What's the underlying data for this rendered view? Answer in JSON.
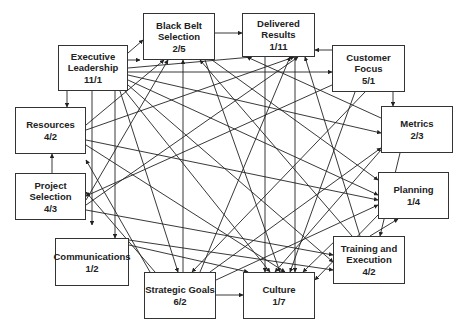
{
  "diagram": {
    "type": "interrelationship-digraph",
    "line_color": "#222222",
    "box_border_color": "#333333",
    "nodes": [
      {
        "id": "black_belt",
        "label": "Black Belt Selection",
        "line1": "Black Belt",
        "line2": "Selection",
        "score": "2/5",
        "x": 143,
        "y": 13,
        "w": 72,
        "h": 47
      },
      {
        "id": "exec_lead",
        "label": "Executive Leadership",
        "line1": "Executive",
        "line2": "Leadership",
        "score": "11/1",
        "x": 58,
        "y": 45,
        "w": 70,
        "h": 46
      },
      {
        "id": "delivered",
        "label": "Delivered Results",
        "line1": "Delivered",
        "line2": "Results",
        "score": "1/11",
        "x": 242,
        "y": 13,
        "w": 73,
        "h": 44
      },
      {
        "id": "customer",
        "label": "Customer Focus",
        "line1": "Customer",
        "line2": "Focus",
        "score": "5/1",
        "x": 332,
        "y": 45,
        "w": 73,
        "h": 47
      },
      {
        "id": "metrics",
        "label": "Metrics",
        "line1": "Metrics",
        "line2": "",
        "score": "2/3",
        "x": 381,
        "y": 106,
        "w": 72,
        "h": 47
      },
      {
        "id": "resources",
        "label": "Resources",
        "line1": "Resources",
        "line2": "",
        "score": "4/2",
        "x": 15,
        "y": 107,
        "w": 71,
        "h": 47
      },
      {
        "id": "project_sel",
        "label": "Project Selection",
        "line1": "Project",
        "line2": "Selection",
        "score": "4/3",
        "x": 15,
        "y": 173,
        "w": 71,
        "h": 47
      },
      {
        "id": "planning",
        "label": "Planning",
        "line1": "Planning",
        "line2": "",
        "score": "1/4",
        "x": 378,
        "y": 172,
        "w": 71,
        "h": 47
      },
      {
        "id": "communications",
        "label": "Communications",
        "line1": "Communications",
        "line2": "",
        "score": "1/2",
        "x": 55,
        "y": 238,
        "w": 74,
        "h": 48
      },
      {
        "id": "training",
        "label": "Training and Execution",
        "line1": "Training and",
        "line2": "Execution",
        "score": "4/2",
        "x": 333,
        "y": 236,
        "w": 72,
        "h": 48
      },
      {
        "id": "strategic",
        "label": "Strategic Goals",
        "line1": "Strategic Goals",
        "line2": "",
        "score": "6/2",
        "x": 144,
        "y": 272,
        "w": 72,
        "h": 47
      },
      {
        "id": "culture",
        "label": "Culture",
        "line1": "Culture",
        "line2": "",
        "score": "1/7",
        "x": 243,
        "y": 272,
        "w": 72,
        "h": 47
      }
    ],
    "edges": [
      {
        "from": "exec_lead",
        "to": "black_belt",
        "x1": 128,
        "y1": 53,
        "x2": 143,
        "y2": 40
      },
      {
        "from": "black_belt",
        "to": "delivered",
        "x1": 215,
        "y1": 33,
        "x2": 242,
        "y2": 33
      },
      {
        "from": "customer",
        "to": "delivered",
        "x1": 332,
        "y1": 50,
        "x2": 315,
        "y2": 50
      },
      {
        "from": "customer",
        "to": "metrics",
        "x1": 393,
        "y1": 92,
        "x2": 393,
        "y2": 106
      },
      {
        "from": "exec_lead",
        "to": "resources",
        "x1": 67,
        "y1": 91,
        "x2": 67,
        "y2": 107
      },
      {
        "from": "project_sel",
        "to": "resources",
        "x1": 52,
        "y1": 173,
        "x2": 52,
        "y2": 154
      },
      {
        "from": "strategic",
        "to": "culture",
        "x1": 216,
        "y1": 295,
        "x2": 243,
        "y2": 295
      },
      {
        "from": "exec_lead",
        "to": "customer",
        "x1": 128,
        "y1": 72,
        "x2": 332,
        "y2": 72
      },
      {
        "from": "exec_lead",
        "to": "communications",
        "x1": 115,
        "y1": 91,
        "x2": 115,
        "y2": 238
      },
      {
        "from": "exec_lead",
        "to": "project_sel",
        "x1": 92,
        "y1": 91,
        "x2": 92,
        "y2": 225
      },
      {
        "from": "exec_lead",
        "to": "metrics",
        "x1": 128,
        "y1": 75,
        "x2": 381,
        "y2": 133
      },
      {
        "from": "exec_lead",
        "to": "planning",
        "x1": 128,
        "y1": 80,
        "x2": 378,
        "y2": 195
      },
      {
        "from": "exec_lead",
        "to": "training",
        "x1": 128,
        "y1": 85,
        "x2": 333,
        "y2": 262
      },
      {
        "from": "exec_lead",
        "to": "strategic",
        "x1": 120,
        "y1": 91,
        "x2": 178,
        "y2": 272
      },
      {
        "from": "exec_lead",
        "to": "culture",
        "x1": 125,
        "y1": 91,
        "x2": 270,
        "y2": 272
      },
      {
        "from": "exec_lead",
        "to": "delivered",
        "x1": 128,
        "y1": 68,
        "x2": 252,
        "y2": 57
      },
      {
        "from": "strategic",
        "to": "black_belt",
        "x1": 183,
        "y1": 272,
        "x2": 183,
        "y2": 60
      },
      {
        "from": "strategic",
        "to": "delivered",
        "x1": 200,
        "y1": 272,
        "x2": 290,
        "y2": 57
      },
      {
        "from": "strategic",
        "to": "resources",
        "x1": 150,
        "y1": 272,
        "x2": 86,
        "y2": 160
      },
      {
        "from": "strategic",
        "to": "project_sel",
        "x1": 155,
        "y1": 272,
        "x2": 86,
        "y2": 192
      },
      {
        "from": "strategic",
        "to": "metrics",
        "x1": 210,
        "y1": 272,
        "x2": 381,
        "y2": 148
      },
      {
        "from": "strategic",
        "to": "planning",
        "x1": 216,
        "y1": 280,
        "x2": 378,
        "y2": 205
      },
      {
        "from": "customer",
        "to": "project_sel",
        "x1": 332,
        "y1": 85,
        "x2": 86,
        "y2": 196
      },
      {
        "from": "customer",
        "to": "culture",
        "x1": 355,
        "y1": 92,
        "x2": 290,
        "y2": 272
      },
      {
        "from": "customer",
        "to": "strategic",
        "x1": 365,
        "y1": 92,
        "x2": 192,
        "y2": 272
      },
      {
        "from": "training",
        "to": "planning",
        "x1": 370,
        "y1": 236,
        "x2": 398,
        "y2": 219
      },
      {
        "from": "training",
        "to": "delivered",
        "x1": 360,
        "y1": 236,
        "x2": 305,
        "y2": 57
      },
      {
        "from": "training",
        "to": "black_belt",
        "x1": 352,
        "y1": 236,
        "x2": 200,
        "y2": 60
      },
      {
        "from": "training",
        "to": "culture",
        "x1": 340,
        "y1": 236,
        "x2": 303,
        "y2": 272
      },
      {
        "from": "project_sel",
        "to": "black_belt",
        "x1": 86,
        "y1": 200,
        "x2": 168,
        "y2": 60
      },
      {
        "from": "project_sel",
        "to": "delivered",
        "x1": 86,
        "y1": 205,
        "x2": 298,
        "y2": 57
      },
      {
        "from": "project_sel",
        "to": "training",
        "x1": 86,
        "y1": 210,
        "x2": 333,
        "y2": 255
      },
      {
        "from": "resources",
        "to": "black_belt",
        "x1": 86,
        "y1": 125,
        "x2": 164,
        "y2": 60
      },
      {
        "from": "resources",
        "to": "delivered",
        "x1": 86,
        "y1": 130,
        "x2": 294,
        "y2": 57
      },
      {
        "from": "resources",
        "to": "planning",
        "x1": 86,
        "y1": 140,
        "x2": 378,
        "y2": 200
      },
      {
        "from": "resources",
        "to": "culture",
        "x1": 86,
        "y1": 145,
        "x2": 285,
        "y2": 272
      },
      {
        "from": "communications",
        "to": "culture",
        "x1": 129,
        "y1": 245,
        "x2": 248,
        "y2": 272
      },
      {
        "from": "communications",
        "to": "training",
        "x1": 129,
        "y1": 240,
        "x2": 333,
        "y2": 270
      },
      {
        "from": "metrics",
        "to": "delivered",
        "x1": 381,
        "y1": 118,
        "x2": 247,
        "y2": 57
      },
      {
        "from": "metrics",
        "to": "culture",
        "x1": 381,
        "y1": 150,
        "x2": 275,
        "y2": 272
      },
      {
        "from": "metrics",
        "to": "training",
        "x1": 400,
        "y1": 153,
        "x2": 380,
        "y2": 236
      },
      {
        "from": "planning",
        "to": "culture",
        "x1": 378,
        "y1": 215,
        "x2": 315,
        "y2": 280
      },
      {
        "from": "black_belt",
        "to": "culture",
        "x1": 205,
        "y1": 60,
        "x2": 280,
        "y2": 272
      },
      {
        "from": "black_belt",
        "to": "planning",
        "x1": 212,
        "y1": 60,
        "x2": 378,
        "y2": 180
      },
      {
        "from": "delivered_v1",
        "to": "culture",
        "x1": 265,
        "y1": 57,
        "x2": 265,
        "y2": 272
      },
      {
        "from": "delivered_v2",
        "to": "culture",
        "x1": 295,
        "y1": 57,
        "x2": 295,
        "y2": 272
      },
      {
        "from": "exec_lead",
        "to": "black_belt_2",
        "x1": 128,
        "y1": 60,
        "x2": 140,
        "y2": 60
      }
    ]
  }
}
